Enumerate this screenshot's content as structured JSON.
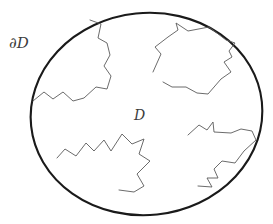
{
  "figure": {
    "background_color": "#ffffff",
    "width": 273,
    "height": 224,
    "labels": {
      "boundary": "∂D",
      "domain": "D"
    },
    "colors": {
      "boundary_stroke": "#1a1a1a",
      "interior_stroke": "#5a5a5a",
      "label_color": "#3c3c3c",
      "fill": "none"
    },
    "strokes": {
      "boundary_width": 2.1,
      "interior_width": 0.9
    },
    "boundary": {
      "shape": "ellipse",
      "center_x": 146.5,
      "center_y": 114,
      "radius_x": 116,
      "radius_y": 101,
      "rotation_deg": -6
    },
    "regions": [
      {
        "name": "top-left-jagged-region",
        "points": "33,101 44,92 53,99 63,92 73,101 84,98 96,87 107,89 111,76 104,66 110,55 107,43 98,38 101,24 90,20"
      },
      {
        "name": "top-right-jagged-region",
        "points": "153,72 161,54 155,47 168,37 178,30 176,23 188,31 209,27 226,40 235,43 229,51 232,57 224,62 231,72 221,79 208,94 197,93 186,87 172,87 163,82"
      },
      {
        "name": "bottom-left-jagged-region",
        "points": "57,158 65,149 76,156 86,143 94,151 104,140 111,151 122,134 132,144 144,139 139,154 150,161 137,174 144,186 134,192 119,190"
      },
      {
        "name": "bottom-right-jagged-region",
        "points": "188,135 199,125 207,130 213,122 214,132 231,133 241,129 252,131 256,140 244,151 235,163 222,161 214,169 218,178 207,178 212,187 198,186"
      }
    ]
  }
}
